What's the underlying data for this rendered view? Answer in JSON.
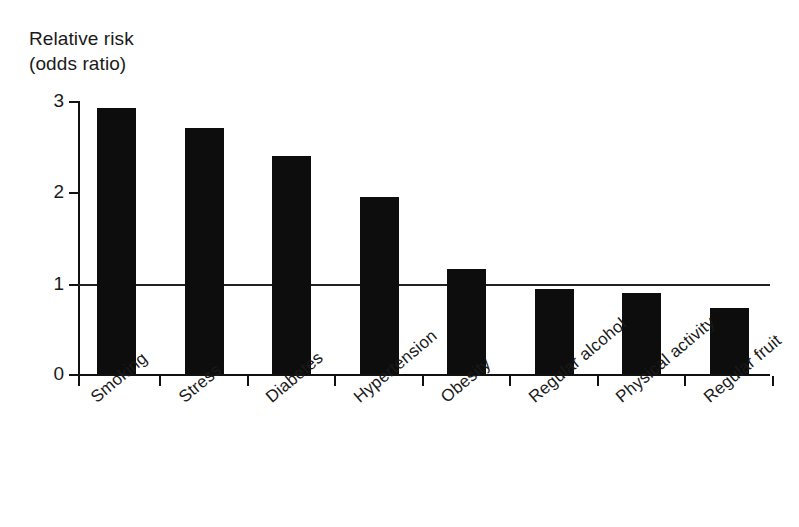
{
  "chart_data": {
    "type": "bar",
    "title": "",
    "ylabel": "Relative risk (odds ratio)",
    "ylabel_lines": [
      "Relative risk",
      "(odds ratio)"
    ],
    "xlabel": "",
    "categories": [
      "Smoking",
      "Stress",
      "Diabetes",
      "Hypertension",
      "Obesity",
      "Regular alcohol",
      "Physical activity",
      "Regular fruit"
    ],
    "values": [
      2.92,
      2.7,
      2.4,
      1.95,
      1.15,
      0.93,
      0.89,
      0.72
    ],
    "ylim": [
      0,
      3.0
    ],
    "yticks": [
      "0",
      "1",
      "2",
      "3"
    ],
    "ytick_values": [
      0,
      1,
      2,
      3
    ],
    "grid": false,
    "legend": "none",
    "annotations": [
      {
        "name": "reference-line",
        "value": 1,
        "description": "horizontal reference line at relative risk = 1"
      }
    ],
    "bar_color": "#0d0d0d",
    "axis_color": "#111111",
    "background_color": "#ffffff"
  }
}
